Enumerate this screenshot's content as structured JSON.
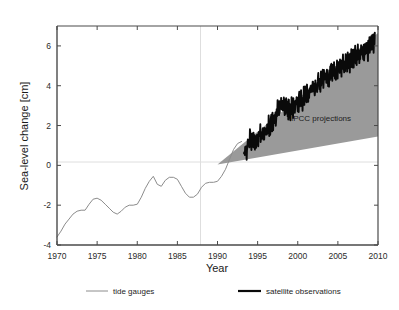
{
  "figure": {
    "background": "#ffffff",
    "axis_color": "#4a4a4a",
    "grid_color": "#d9d9d9",
    "cone_color": "#9a9a9a",
    "tide_color": "#8c8c8c",
    "satellite_color": "#0a0a0a"
  },
  "axes": {
    "xlabel": "Year",
    "ylabel": "Sea-level change [cm]",
    "xticks": [
      "1970",
      "1975",
      "1980",
      "1985",
      "1990",
      "1995",
      "2000",
      "2005",
      "2010"
    ],
    "yticks": [
      "6",
      "4",
      "2",
      "0",
      "-2",
      "-4"
    ]
  },
  "annotations": {
    "ipcc": "IPCC projections"
  },
  "legend": {
    "items": [
      {
        "label": "tide gauges",
        "swatch": "thin-gray-line"
      },
      {
        "label": "satellite observations",
        "swatch": "thick-black-line"
      }
    ]
  },
  "chart_data": {
    "type": "line",
    "title": "",
    "xlabel": "Year",
    "ylabel": "Sea-level change [cm]",
    "xlim": [
      1970,
      2010
    ],
    "ylim": [
      -4,
      7
    ],
    "xticks": [
      1970,
      1975,
      1980,
      1985,
      1990,
      1995,
      2000,
      2005,
      2010
    ],
    "yticks": [
      -4,
      -2,
      0,
      2,
      4,
      6
    ],
    "grid": "zero-line and 1990 vertical reference line only",
    "legend_position": "below-axes",
    "annotations": [
      {
        "text": "IPCC projections",
        "x": 2000.4,
        "y": 2.35
      }
    ],
    "series": [
      {
        "name": "tide gauges",
        "type": "line",
        "style": "thin gray",
        "x": [
          1970.0,
          1970.5,
          1971.0,
          1971.5,
          1972.0,
          1972.5,
          1973.0,
          1973.5,
          1974.0,
          1974.5,
          1975.0,
          1975.5,
          1976.0,
          1976.5,
          1977.0,
          1977.5,
          1978.0,
          1978.5,
          1979.0,
          1979.5,
          1980.0,
          1980.5,
          1981.0,
          1981.5,
          1982.0,
          1982.5,
          1983.0,
          1983.5,
          1984.0,
          1984.5,
          1985.0,
          1985.5,
          1986.0,
          1986.5,
          1987.0,
          1987.5,
          1988.0,
          1988.5,
          1989.0,
          1989.5,
          1990.0,
          1990.5,
          1991.0,
          1991.5,
          1992.0,
          1992.5,
          1993.0
        ],
        "y": [
          -3.6,
          -3.3,
          -2.95,
          -2.7,
          -2.45,
          -2.3,
          -2.25,
          -2.25,
          -1.95,
          -1.7,
          -1.65,
          -1.75,
          -1.95,
          -2.15,
          -2.35,
          -2.45,
          -2.3,
          -2.1,
          -2.0,
          -2.0,
          -1.95,
          -1.6,
          -1.15,
          -0.8,
          -0.55,
          -0.95,
          -1.05,
          -0.75,
          -0.6,
          -0.6,
          -0.7,
          -1.05,
          -1.4,
          -1.6,
          -1.6,
          -1.45,
          -1.1,
          -0.9,
          -0.85,
          -0.85,
          -0.8,
          -0.55,
          -0.2,
          0.3,
          0.8,
          1.1,
          1.2
        ]
      },
      {
        "name": "satellite observations",
        "type": "line",
        "style": "thick black, high-frequency noise",
        "x_start": 1993.3,
        "x_end": 2009.6,
        "y_start": 0.55,
        "y_end": 6.2,
        "trend_cm_per_year": 0.345,
        "noise_amplitude_cm": 0.45,
        "anchor_points": [
          {
            "x": 1993.3,
            "y": 0.55
          },
          {
            "x": 1994.0,
            "y": 1.3
          },
          {
            "x": 1995.0,
            "y": 1.35
          },
          {
            "x": 1996.0,
            "y": 1.75
          },
          {
            "x": 1997.0,
            "y": 2.35
          },
          {
            "x": 1998.0,
            "y": 3.05
          },
          {
            "x": 1999.0,
            "y": 2.85
          },
          {
            "x": 2000.0,
            "y": 3.15
          },
          {
            "x": 2001.0,
            "y": 3.6
          },
          {
            "x": 2002.0,
            "y": 3.95
          },
          {
            "x": 2003.0,
            "y": 4.35
          },
          {
            "x": 2004.0,
            "y": 4.55
          },
          {
            "x": 2005.0,
            "y": 4.95
          },
          {
            "x": 2006.0,
            "y": 5.15
          },
          {
            "x": 2007.0,
            "y": 5.45
          },
          {
            "x": 2008.0,
            "y": 5.7
          },
          {
            "x": 2009.0,
            "y": 6.0
          },
          {
            "x": 2009.6,
            "y": 6.2
          }
        ]
      }
    ],
    "bands": [
      {
        "name": "IPCC projections",
        "type": "area",
        "fill": "#9a9a9a",
        "x": [
          1990.0,
          2010.0
        ],
        "y_upper": [
          0.05,
          6.65
        ],
        "y_lower": [
          0.05,
          1.45
        ]
      }
    ]
  }
}
